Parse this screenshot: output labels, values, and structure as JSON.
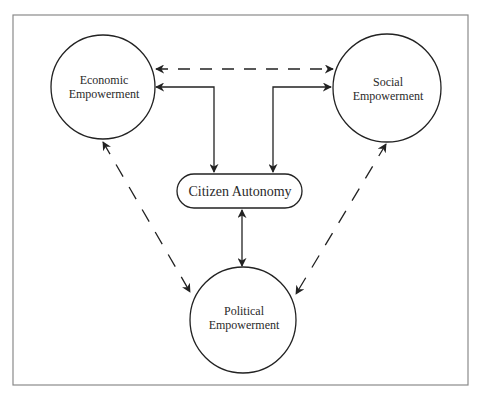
{
  "diagram": {
    "nodes": {
      "economic": {
        "line1": "Economic",
        "line2": "Empowerment"
      },
      "social": {
        "line1": "Social",
        "line2": "Empowerment"
      },
      "political": {
        "line1": "Political",
        "line2": "Empowerment"
      },
      "citizen": {
        "label": "Citizen Autonomy"
      }
    },
    "edges": [
      {
        "from": "Economic Empowerment",
        "to": "Social Empowerment",
        "style": "dashed",
        "direction": "bidirectional"
      },
      {
        "from": "Economic Empowerment",
        "to": "Citizen Autonomy",
        "style": "solid",
        "direction": "bidirectional"
      },
      {
        "from": "Social Empowerment",
        "to": "Citizen Autonomy",
        "style": "solid",
        "direction": "bidirectional"
      },
      {
        "from": "Citizen Autonomy",
        "to": "Political Empowerment",
        "style": "solid",
        "direction": "bidirectional"
      },
      {
        "from": "Economic Empowerment",
        "to": "Political Empowerment",
        "style": "dashed",
        "direction": "bidirectional"
      },
      {
        "from": "Social Empowerment",
        "to": "Political Empowerment",
        "style": "dashed",
        "direction": "bidirectional"
      }
    ],
    "colors": {
      "frame": "#8a8a8a",
      "stroke": "#222222",
      "text": "#2a2a2a"
    }
  }
}
